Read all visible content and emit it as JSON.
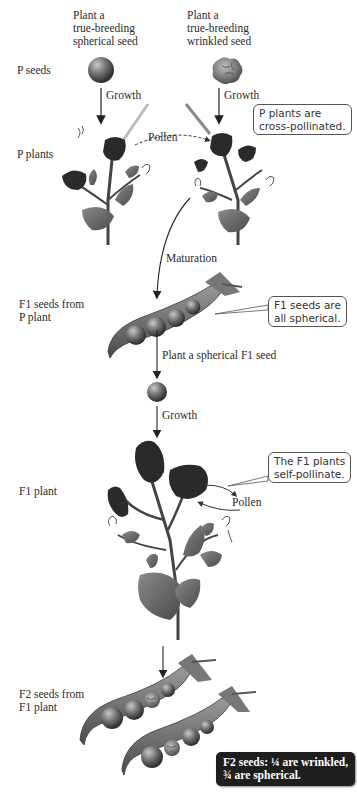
{
  "columns": {
    "left_header": [
      "Plant a",
      "true-breeding",
      "spherical seed"
    ],
    "right_header": [
      "Plant a",
      "true-breeding",
      "wrinkled seed"
    ]
  },
  "row_labels": {
    "p_seeds": "P seeds",
    "p_plants": "P plants",
    "f1_seeds": [
      "F1 seeds from",
      "P plant"
    ],
    "f1_plant": "F1  plant",
    "f2_seeds": [
      "F2 seeds from",
      "F1 plant"
    ]
  },
  "arrows": {
    "growth_left": "Growth",
    "growth_right": "Growth",
    "pollen_cross": "Pollen",
    "maturation": "Maturation",
    "plant_f1_seed": "Plant a spherical F1 seed",
    "growth_f1": "Growth",
    "pollen_self": "Pollen"
  },
  "callouts": {
    "cross_pollinated": [
      "P plants are",
      "cross-pollinated."
    ],
    "f1_spherical": [
      "F1 seeds are",
      "all spherical."
    ],
    "self_pollinate": [
      "The F1 plants",
      "self-pollinate."
    ],
    "f2_result": [
      "F2 seeds: ¼  are wrinkled,",
      "¾  are spherical."
    ]
  },
  "colors": {
    "seed_dark": "#3a3a3a",
    "seed_light": "#9a9a9a",
    "pod": "#6e6e6e",
    "leaf": "#6a6a6a",
    "flower": "#2a2a2a",
    "dark_callout_bg": "#1e1e1e"
  }
}
